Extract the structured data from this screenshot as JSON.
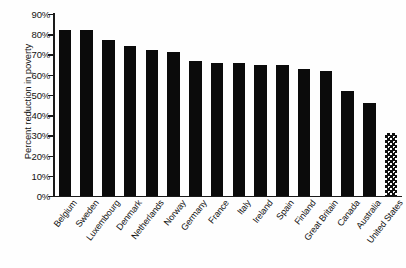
{
  "chart_data": {
    "type": "bar",
    "title": "",
    "subtitle": "",
    "xlabel": "",
    "ylabel": "Percent reduction in poverty",
    "ylim": [
      0,
      90
    ],
    "ytick_labels": [
      "90%",
      "80%",
      "70%",
      "60%",
      "50%",
      "40%",
      "30%",
      "20%",
      "10%",
      "0%"
    ],
    "ytick_values": [
      90,
      80,
      70,
      60,
      50,
      40,
      30,
      20,
      10,
      0
    ],
    "grid": false,
    "legend": null,
    "categories": [
      "Belgium",
      "Sweden",
      "Luxembourg",
      "Denmark",
      "Netherlands",
      "Norway",
      "Germany",
      "France",
      "Italy",
      "Ireland",
      "Spain",
      "Finland",
      "Great Britain",
      "Canada",
      "Australia",
      "United States"
    ],
    "values": [
      82,
      82,
      77,
      74,
      72,
      71,
      67,
      66,
      66,
      65,
      65,
      63,
      62,
      52,
      46,
      31
    ],
    "bar_fills": [
      "solid",
      "solid",
      "solid",
      "solid",
      "solid",
      "solid",
      "solid",
      "solid",
      "solid",
      "solid",
      "solid",
      "solid",
      "solid",
      "solid",
      "solid",
      "dotted"
    ],
    "colors": {
      "bar_solid": "#0b0b0b",
      "bar_pattern": "#101010",
      "axis": "#1a1a1a",
      "text": "#131313",
      "background": "#fefefe"
    }
  }
}
